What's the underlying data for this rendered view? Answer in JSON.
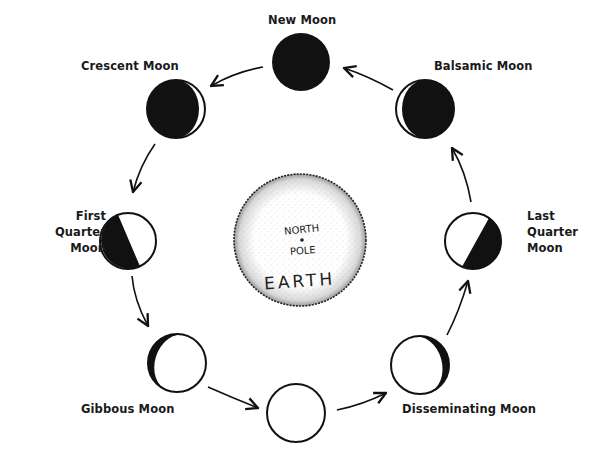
{
  "diagram": {
    "center": {
      "name": "Earth",
      "labels": {
        "top": "NORTH",
        "middle": "POLE",
        "bottom": "EARTH"
      }
    },
    "phases": [
      {
        "id": "new",
        "label": "New Moon"
      },
      {
        "id": "crescent",
        "label": "Crescent Moon"
      },
      {
        "id": "first-quarter",
        "label_lines": [
          "First",
          "Quarter",
          "Moon"
        ]
      },
      {
        "id": "gibbous",
        "label": "Gibbous Moon"
      },
      {
        "id": "full",
        "label": ""
      },
      {
        "id": "disseminating",
        "label": "Disseminating Moon"
      },
      {
        "id": "last-quarter",
        "label_lines": [
          "Last",
          "Quarter",
          "Moon"
        ]
      },
      {
        "id": "balsamic",
        "label": "Balsamic Moon"
      }
    ],
    "direction": "counter-clockwise",
    "colors": {
      "ink": "#111111",
      "background": "#ffffff",
      "earth_stipple": "#555555"
    }
  }
}
